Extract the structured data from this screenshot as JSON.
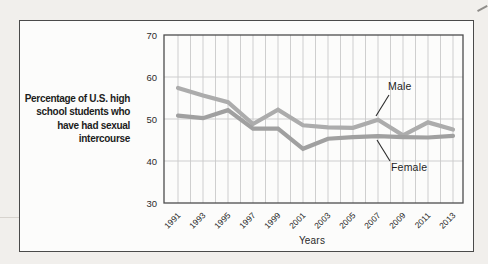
{
  "figure": {
    "background": "#fcfcfb",
    "border_color": "#4a4a4a",
    "page_background": "#f1efec"
  },
  "side_label": {
    "lines": [
      "Percentage of U.S. high",
      "school students who",
      "have had sexual",
      "intercourse"
    ]
  },
  "chart_data": {
    "type": "line",
    "title": "Percentage of U.S. high school students who have had sexual intercourse",
    "xlabel": "Years",
    "ylabel": "",
    "x": [
      1991,
      1993,
      1995,
      1997,
      1999,
      2001,
      2003,
      2005,
      2007,
      2009,
      2011,
      2013
    ],
    "x_tick_labels": [
      "1991",
      "1993",
      "1995",
      "1997",
      "1999",
      "2001",
      "2003",
      "2005",
      "2007",
      "2009",
      "2011",
      "2013"
    ],
    "ylim": [
      30,
      70
    ],
    "yticks": [
      30,
      40,
      50,
      60,
      70
    ],
    "grid": true,
    "gridline_color": "#c9c9c9",
    "legend_position": "annotated-on-plot",
    "series": [
      {
        "name": "Male",
        "color": "#acacac",
        "values": [
          57.4,
          55.6,
          54.0,
          48.8,
          52.2,
          48.5,
          48.0,
          47.9,
          49.8,
          46.1,
          49.2,
          47.5
        ]
      },
      {
        "name": "Female",
        "color": "#a0a0a0",
        "values": [
          50.8,
          50.2,
          52.1,
          47.7,
          47.7,
          42.9,
          45.3,
          45.7,
          45.9,
          45.7,
          45.6,
          46.0
        ]
      }
    ],
    "annotations": [
      {
        "label": "Male",
        "points_to": {
          "x": 2007,
          "y": 49.8
        }
      },
      {
        "label": "Female",
        "points_to": {
          "x": 2007,
          "y": 45.9
        }
      }
    ]
  }
}
